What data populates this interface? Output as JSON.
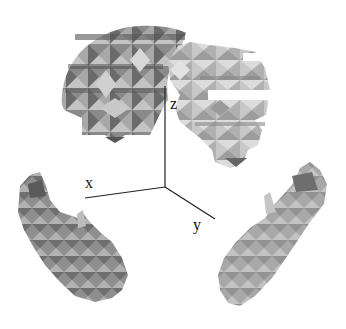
{
  "figure": {
    "axes": {
      "x_label": "x",
      "y_label": "y",
      "z_label": "z"
    },
    "objects": [
      {
        "name": "top-left-cluster",
        "shade": "#7a7a7a"
      },
      {
        "name": "top-right-cluster",
        "shade": "#b8b8b8"
      },
      {
        "name": "bottom-left-cluster",
        "shade": "#8c8c8c"
      },
      {
        "name": "bottom-right-cluster",
        "shade": "#a6a6a6"
      }
    ],
    "colors": {
      "background": "#ffffff",
      "axis_line": "#222222"
    }
  }
}
